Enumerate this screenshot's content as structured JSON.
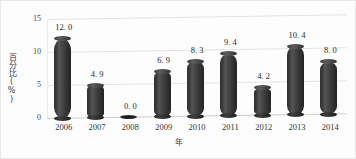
{
  "chart_data": {
    "type": "bar",
    "title": "",
    "subtitle": "",
    "xlabel": "年",
    "ylabel": "百分比(%)",
    "categories": [
      "2006",
      "2007",
      "2008",
      "2009",
      "2010",
      "2011",
      "2012",
      "2013",
      "2014"
    ],
    "values": [
      12.0,
      4.9,
      0.0,
      6.9,
      8.3,
      9.4,
      4.2,
      10.4,
      8.0
    ],
    "data_labels": [
      "12. 0",
      "4. 9",
      "0. 0",
      "6. 9",
      "8. 3",
      "9. 4",
      "4. 2",
      "10. 4",
      "8. 0"
    ],
    "ylim": [
      0,
      15
    ],
    "yticks": [
      0,
      5,
      10,
      15
    ],
    "ytick_labels": [
      "0",
      "5",
      "10",
      "15"
    ],
    "grid": true,
    "legend": "none",
    "legend_position": "none",
    "style": "3d-cylinder",
    "series": [
      {
        "name": "百分比(%)",
        "values": [
          12.0,
          4.9,
          0.0,
          6.9,
          8.3,
          9.4,
          4.2,
          10.4,
          8.0
        ]
      }
    ],
    "colors": {
      "bar": "#3a3a3a",
      "bar_highlight": "#555555",
      "gridline": "#e3e3e3",
      "baseline": "#cdcdcd",
      "text": "#2b2b2b",
      "background": "#fdfdfd"
    }
  }
}
